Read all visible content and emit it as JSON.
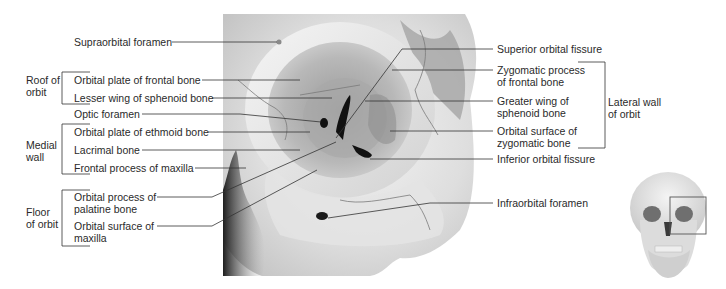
{
  "diagram": {
    "groups": [
      {
        "id": "roof",
        "label_lines": [
          "Roof of",
          "orbit"
        ]
      },
      {
        "id": "medial",
        "label_lines": [
          "Medial",
          "wall"
        ]
      },
      {
        "id": "floor",
        "label_lines": [
          "Floor",
          "of orbit"
        ]
      },
      {
        "id": "lateral",
        "label_lines": [
          "Lateral wall",
          "of orbit"
        ]
      }
    ],
    "left_labels": [
      {
        "text": "Supraorbital foramen"
      },
      {
        "text": "Orbital plate of frontal bone"
      },
      {
        "text": "Lesser wing of sphenoid bone"
      },
      {
        "text": "Optic foramen"
      },
      {
        "text": "Orbital plate of ethmoid bone"
      },
      {
        "text": "Lacrimal bone"
      },
      {
        "text": "Frontal process of maxilla"
      },
      {
        "text_lines": [
          "Orbital process of",
          "palatine bone"
        ]
      },
      {
        "text_lines": [
          "Orbital surface of",
          "maxilla"
        ]
      }
    ],
    "right_labels": [
      {
        "text": "Superior orbital fissure"
      },
      {
        "text_lines": [
          "Zygomatic process",
          "of frontal bone"
        ]
      },
      {
        "text_lines": [
          "Greater wing of",
          "sphenoid bone"
        ]
      },
      {
        "text_lines": [
          "Orbital surface of",
          "zygomatic bone"
        ]
      },
      {
        "text": "Inferior orbital fissure"
      },
      {
        "text": "Infraorbital foramen"
      }
    ],
    "inset": {
      "name": "skull-thumbnail",
      "highlight": "left orbit region box"
    },
    "colors": {
      "text": "#2a2a2a",
      "leader": "#333333",
      "bone_light": "#e8e8e8",
      "bone_mid": "#bdbdbd",
      "cavity": "#8a8a8a",
      "shadow": "#222222"
    }
  }
}
